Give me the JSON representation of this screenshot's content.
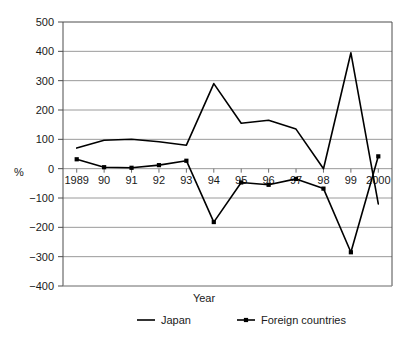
{
  "chart_data": {
    "type": "line",
    "title": "",
    "xlabel": "Year",
    "ylabel": "%",
    "categories": [
      "1989",
      "90",
      "91",
      "92",
      "93",
      "94",
      "95",
      "96",
      "97",
      "98",
      "99",
      "2000"
    ],
    "ylim": [
      -400,
      500
    ],
    "yticks": [
      500,
      400,
      300,
      200,
      100,
      0,
      -100,
      -200,
      -300,
      -400
    ],
    "ytick_labels": [
      "500",
      "400",
      "300",
      "200",
      "100",
      "0",
      "−100",
      "−200",
      "−300",
      "−400"
    ],
    "grid": true,
    "legend_position": "bottom",
    "series": [
      {
        "name": "Japan",
        "marker": "none",
        "color": "#000000",
        "values": [
          70,
          97,
          100,
          92,
          80,
          290,
          155,
          165,
          135,
          0,
          395,
          -120
        ]
      },
      {
        "name": "Foreign countries",
        "marker": "dot",
        "color": "#000000",
        "values": [
          32,
          5,
          3,
          12,
          27,
          -182,
          -47,
          -55,
          -35,
          -68,
          -285,
          42
        ]
      }
    ]
  },
  "legend": {
    "entries": [
      {
        "label": "Japan"
      },
      {
        "label": "Foreign countries"
      }
    ]
  },
  "axes": {
    "y_axis_label": "%",
    "x_axis_label": "Year"
  }
}
